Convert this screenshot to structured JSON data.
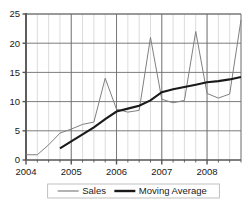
{
  "chart_data": {
    "type": "line",
    "title": "",
    "xlabel": "",
    "ylabel": "",
    "xlim": [
      2004.0,
      2008.75
    ],
    "ylim": [
      0,
      25
    ],
    "grid": true,
    "grid_major_x": true,
    "grid_minor_x": true,
    "grid_major_y": true,
    "legend_position": "bottom",
    "y_ticks": [
      0,
      5,
      10,
      15,
      20,
      25
    ],
    "y_tick_labels": [
      "0",
      "5",
      "10",
      "15",
      "20",
      "25"
    ],
    "x_ticks": [
      2004,
      2005,
      2006,
      2007,
      2008
    ],
    "x_tick_labels": [
      "2004",
      "2005",
      "2006",
      "2007",
      "2008"
    ],
    "x_minor_step": 0.25,
    "series": [
      {
        "name": "Sales",
        "color": "#808080",
        "width": 1.0,
        "x": [
          2004.0,
          2004.25,
          2004.5,
          2004.75,
          2005.0,
          2005.25,
          2005.5,
          2005.75,
          2006.0,
          2006.25,
          2006.5,
          2006.75,
          2007.0,
          2007.25,
          2007.5,
          2007.75,
          2008.0,
          2008.25,
          2008.5,
          2008.75
        ],
        "values": [
          0.9,
          0.9,
          2.6,
          4.6,
          5.3,
          6.1,
          6.5,
          14.0,
          8.7,
          8.2,
          8.5,
          21.0,
          10.4,
          9.8,
          10.2,
          22.0,
          11.4,
          10.6,
          11.3,
          24.0
        ]
      },
      {
        "name": "Moving Average",
        "color": "#1a1a1a",
        "width": 2.1,
        "x": [
          2004.75,
          2005.0,
          2005.25,
          2005.5,
          2005.75,
          2006.0,
          2006.25,
          2006.5,
          2006.75,
          2007.0,
          2007.25,
          2007.5,
          2007.75,
          2008.0,
          2008.25,
          2008.5,
          2008.75
        ],
        "values": [
          2.0,
          3.2,
          4.4,
          5.6,
          7.0,
          8.3,
          8.8,
          9.3,
          10.2,
          11.6,
          12.1,
          12.5,
          12.9,
          13.3,
          13.5,
          13.8,
          14.2
        ]
      }
    ]
  },
  "legend": {
    "items": [
      {
        "label": "Sales",
        "color": "#808080",
        "width": 1.2
      },
      {
        "label": "Moving Average",
        "color": "#1a1a1a",
        "width": 2.4
      }
    ]
  },
  "colors": {
    "axis": "#555555",
    "grid_major": "#6e6e6e",
    "grid_minor": "#d4d4d4",
    "text": "#1a1a1a",
    "background": "#ffffff",
    "legend_border": "#b0b0b0"
  }
}
